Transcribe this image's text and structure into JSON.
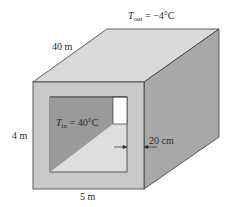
{
  "diagram": {
    "type": "3d-box-cross-section",
    "labels": {
      "t_out_symbol": "T",
      "t_out_sub": "out",
      "t_out_value": " = −4°C",
      "t_in_symbol": "T",
      "t_in_sub": "in",
      "t_in_value": " = 40°C",
      "length": "40 m",
      "height": "4 m",
      "width": "5 m",
      "wall_thickness": "20 cm"
    },
    "colors": {
      "top_face": "#dadada",
      "front_face": "#c9c9c9",
      "right_face": "#a8a8a8",
      "inner_back_wall": "#9a9a9a",
      "inner_floor": "#dedede",
      "door": "#ffffff",
      "edge": "#3a3a3a"
    }
  }
}
